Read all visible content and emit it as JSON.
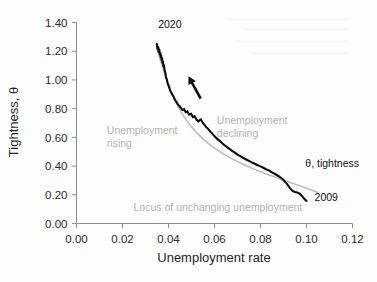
{
  "chart_data": {
    "type": "line",
    "title": "",
    "xlabel": "Unemployment rate",
    "ylabel": "Tightness, θ",
    "xlim": [
      0.0,
      0.12
    ],
    "ylim": [
      0.0,
      1.4
    ],
    "grid": false,
    "legend_position": "inline-annotations",
    "x_ticks": [
      "0.00",
      "0.02",
      "0.04",
      "0.06",
      "0.08",
      "0.10",
      "0.12"
    ],
    "x_tick_values": [
      0.0,
      0.02,
      0.04,
      0.06,
      0.08,
      0.1,
      0.12
    ],
    "y_ticks": [
      "0.00",
      "0.20",
      "0.40",
      "0.60",
      "0.80",
      "1.00",
      "1.20",
      "1.40"
    ],
    "y_tick_values": [
      0.0,
      0.2,
      0.4,
      0.6,
      0.8,
      1.0,
      1.2,
      1.4
    ],
    "series": [
      {
        "name": "θ, tightness",
        "color": "#0d0d0d",
        "style": "jagged-line",
        "points": [
          [
            0.0349,
            1.252
          ],
          [
            0.0352,
            1.218
          ],
          [
            0.0355,
            1.23
          ],
          [
            0.0357,
            1.196
          ],
          [
            0.036,
            1.212
          ],
          [
            0.0362,
            1.178
          ],
          [
            0.0364,
            1.19
          ],
          [
            0.0366,
            1.16
          ],
          [
            0.0368,
            1.172
          ],
          [
            0.037,
            1.14
          ],
          [
            0.0372,
            1.152
          ],
          [
            0.0374,
            1.118
          ],
          [
            0.0376,
            1.128
          ],
          [
            0.0378,
            1.094
          ],
          [
            0.038,
            1.102
          ],
          [
            0.0383,
            1.068
          ],
          [
            0.0386,
            1.052
          ],
          [
            0.0389,
            1.02
          ],
          [
            0.0392,
            1.008
          ],
          [
            0.0396,
            0.978
          ],
          [
            0.04,
            0.962
          ],
          [
            0.0405,
            0.938
          ],
          [
            0.041,
            0.916
          ],
          [
            0.0416,
            0.9
          ],
          [
            0.0422,
            0.884
          ],
          [
            0.0428,
            0.862
          ],
          [
            0.0434,
            0.848
          ],
          [
            0.044,
            0.832
          ],
          [
            0.0447,
            0.818
          ],
          [
            0.0454,
            0.806
          ],
          [
            0.0461,
            0.79
          ],
          [
            0.0468,
            0.796
          ],
          [
            0.0475,
            0.774
          ],
          [
            0.0482,
            0.782
          ],
          [
            0.049,
            0.758
          ],
          [
            0.0498,
            0.766
          ],
          [
            0.0506,
            0.74
          ],
          [
            0.0514,
            0.748
          ],
          [
            0.0522,
            0.722
          ],
          [
            0.053,
            0.71
          ],
          [
            0.054,
            0.726
          ],
          [
            0.055,
            0.7
          ],
          [
            0.0558,
            0.684
          ],
          [
            0.0566,
            0.668
          ],
          [
            0.0574,
            0.656
          ],
          [
            0.0582,
            0.64
          ],
          [
            0.059,
            0.626
          ],
          [
            0.0598,
            0.612
          ],
          [
            0.0606,
            0.598
          ],
          [
            0.0616,
            0.584
          ],
          [
            0.0626,
            0.57
          ],
          [
            0.0636,
            0.556
          ],
          [
            0.0646,
            0.542
          ],
          [
            0.0656,
            0.53
          ],
          [
            0.0666,
            0.518
          ],
          [
            0.0678,
            0.504
          ],
          [
            0.069,
            0.492
          ],
          [
            0.0702,
            0.478
          ],
          [
            0.0714,
            0.468
          ],
          [
            0.0726,
            0.456
          ],
          [
            0.0738,
            0.446
          ],
          [
            0.075,
            0.436
          ],
          [
            0.0762,
            0.426
          ],
          [
            0.0775,
            0.416
          ],
          [
            0.0788,
            0.406
          ],
          [
            0.08,
            0.398
          ],
          [
            0.0812,
            0.388
          ],
          [
            0.0824,
            0.378
          ],
          [
            0.0836,
            0.37
          ],
          [
            0.0848,
            0.358
          ],
          [
            0.086,
            0.348
          ],
          [
            0.0872,
            0.336
          ],
          [
            0.0884,
            0.324
          ],
          [
            0.0896,
            0.31
          ],
          [
            0.0906,
            0.292
          ],
          [
            0.0916,
            0.274
          ],
          [
            0.0924,
            0.256
          ],
          [
            0.0932,
            0.238
          ],
          [
            0.094,
            0.226
          ],
          [
            0.095,
            0.22
          ],
          [
            0.096,
            0.216
          ],
          [
            0.097,
            0.208
          ],
          [
            0.0978,
            0.196
          ],
          [
            0.0986,
            0.18
          ],
          [
            0.0994,
            0.166
          ],
          [
            0.1,
            0.158
          ]
        ]
      },
      {
        "name": "Locus of unchanging unemployment",
        "color": "#bdbdbd",
        "style": "smooth-line",
        "points": [
          [
            0.0348,
            1.232
          ],
          [
            0.037,
            1.11
          ],
          [
            0.0395,
            0.985
          ],
          [
            0.042,
            0.885
          ],
          [
            0.045,
            0.79
          ],
          [
            0.048,
            0.715
          ],
          [
            0.0515,
            0.645
          ],
          [
            0.055,
            0.59
          ],
          [
            0.059,
            0.537
          ],
          [
            0.063,
            0.494
          ],
          [
            0.0675,
            0.452
          ],
          [
            0.072,
            0.416
          ],
          [
            0.0765,
            0.384
          ],
          [
            0.0815,
            0.352
          ],
          [
            0.0865,
            0.322
          ],
          [
            0.0915,
            0.294
          ],
          [
            0.096,
            0.268
          ],
          [
            0.1,
            0.245
          ],
          [
            0.103,
            0.228
          ],
          [
            0.105,
            0.216
          ]
        ]
      }
    ],
    "annotations": [
      {
        "id": "start-year",
        "text": "2020",
        "color": "#111111",
        "x": 0.0355,
        "y": 1.365
      },
      {
        "id": "end-year",
        "text": "2009",
        "color": "#111111",
        "x": 0.1035,
        "y": 0.155
      },
      {
        "id": "series-label",
        "text": "θ, tightness",
        "color": "#111111",
        "x": 0.0995,
        "y": 0.395
      },
      {
        "id": "unemployment-rising",
        "text": "Unemployment",
        "text2": "rising",
        "color": "#b3b3b3",
        "x": 0.0132,
        "y": 0.62
      },
      {
        "id": "unemployment-declining",
        "text": "Unemployment",
        "text2": "declining",
        "color": "#b3b3b3",
        "x": 0.061,
        "y": 0.69
      },
      {
        "id": "locus-label",
        "text": "Locus of unchanging unemployment",
        "color": "#b3b3b3",
        "x": 0.0248,
        "y": 0.09
      }
    ],
    "arrow": {
      "id": "direction-arrow",
      "description": "arrow pointing up-left along the curve toward 2020",
      "from_x": 0.054,
      "from_y": 0.87,
      "to_x": 0.0487,
      "to_y": 1.025
    }
  },
  "labels": {
    "y_axis_title": "Tightness, θ",
    "x_axis_title": "Unemployment rate"
  },
  "colors": {
    "data_line": "#0d0d0d",
    "locus_line": "#bdbdbd",
    "annotation_gray": "#b3b3b3",
    "axis": "#8c8c8c",
    "background": "#fdfdfd"
  }
}
